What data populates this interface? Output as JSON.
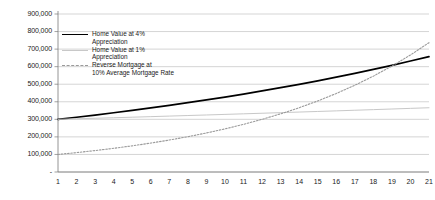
{
  "chart_data": {
    "type": "line",
    "title": "",
    "xlabel": "",
    "ylabel": "",
    "x": [
      1,
      2,
      3,
      4,
      5,
      6,
      7,
      8,
      9,
      10,
      11,
      12,
      13,
      14,
      15,
      16,
      17,
      18,
      19,
      20,
      21
    ],
    "xlim": [
      1,
      21
    ],
    "ylim": [
      0,
      900000
    ],
    "ytick_labels": [
      "-",
      "100,000",
      "200,000",
      "300,000",
      "400,000",
      "500,000",
      "600,000",
      "700,000",
      "800,000",
      "900,000"
    ],
    "ytick_values": [
      0,
      100000,
      200000,
      300000,
      400000,
      500000,
      600000,
      700000,
      800000,
      900000
    ],
    "xtick_labels": [
      "1",
      "2",
      "3",
      "4",
      "5",
      "6",
      "7",
      "8",
      "9",
      "10",
      "11",
      "12",
      "13",
      "14",
      "15",
      "16",
      "17",
      "18",
      "19",
      "20",
      "21"
    ],
    "grid": true,
    "legend_position": "upper-left-inside",
    "series": [
      {
        "name": "Home Value at 4% Appreciation",
        "style": "solid",
        "color": "#000000",
        "values": [
          300000,
          312000,
          324480,
          337459,
          350958,
          364996,
          379596,
          394780,
          410571,
          426994,
          444074,
          461837,
          480310,
          499522,
          519503,
          540283,
          561895,
          584370,
          607745,
          632055,
          657337
        ]
      },
      {
        "name": "Home Value at 1% Appreciation",
        "style": "solid-light",
        "color": "#c8c8c8",
        "values": [
          300000,
          303000,
          306030,
          309090,
          312181,
          315303,
          318456,
          321641,
          324857,
          328106,
          331387,
          334701,
          338048,
          341428,
          344842,
          348291,
          351774,
          355292,
          358845,
          362433,
          366057
        ]
      },
      {
        "name": "Reverse Mortgage at 10% Average Mortgage Rate",
        "style": "dotted",
        "color": "#9a9a9a",
        "values": [
          100000,
          110500,
          122103,
          134923,
          149090,
          164744,
          182042,
          201156,
          222277,
          245616,
          271406,
          299904,
          331394,
          366191,
          404641,
          447128,
          494077,
          545955,
          603280,
          666625,
          736621
        ]
      }
    ]
  },
  "legend": {
    "items": [
      {
        "label": "Home Value at 4%\nAppreciation",
        "icon": "solid-line-swatch"
      },
      {
        "label": "Home Value at 1%\nAppreciation",
        "icon": "light-solid-line-swatch"
      },
      {
        "label": "Reverse Mortgage at\n10% Average Mortgage Rate",
        "icon": "dotted-line-swatch"
      }
    ]
  }
}
